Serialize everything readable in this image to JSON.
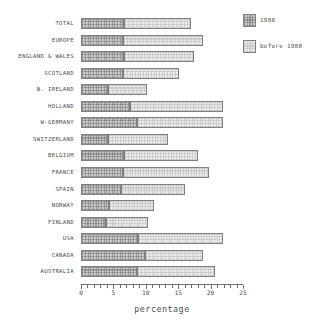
{
  "chart_data": {
    "type": "bar",
    "orientation": "horizontal",
    "stacked": true,
    "title": "",
    "xlabel": "percentage",
    "ylabel": "",
    "xlim": [
      0,
      25
    ],
    "xticks": [
      0,
      5,
      10,
      15,
      20,
      25
    ],
    "xtick_labels": [
      "0",
      "5",
      "10",
      "15",
      "20",
      "25"
    ],
    "minor_tick_step": 1,
    "grid": false,
    "legend_position": "top-right",
    "categories": [
      "TOTAL",
      "EUROPE",
      "ENGLAND & WALES",
      "SCOTLAND",
      "N. IRELAND",
      "HOLLAND",
      "W-GERMANY",
      "SWITZERLAND",
      "BELGIUM",
      "FRANCE",
      "SPAIN",
      "NORWAY",
      "FINLAND",
      "USA",
      "CANADA",
      "AUSTRALIA"
    ],
    "series": [
      {
        "name": "1988",
        "color": "#c9c9c9",
        "values": [
          6.6,
          6.5,
          6.6,
          6.5,
          4.2,
          7.5,
          8.6,
          4.1,
          6.6,
          6.5,
          6.2,
          4.3,
          3.9,
          8.8,
          9.8,
          8.6
        ]
      },
      {
        "name": "before 1988",
        "color": "#ececec",
        "values": [
          10.3,
          12.3,
          10.8,
          8.7,
          6.0,
          14.4,
          13.3,
          9.4,
          11.5,
          13.2,
          9.8,
          6.9,
          6.5,
          13.1,
          9.1,
          12.1
        ]
      }
    ],
    "totals": [
      16.9,
      18.8,
      17.4,
      15.2,
      10.2,
      21.9,
      21.9,
      13.5,
      18.1,
      19.7,
      16.0,
      11.2,
      10.4,
      21.9,
      18.9,
      20.7
    ]
  },
  "legend": {
    "items": [
      {
        "label": "1988",
        "swatch": "hatched-dark"
      },
      {
        "label": "before 1988",
        "swatch": "plain-light"
      }
    ]
  },
  "axis": {
    "x_title": "percentage"
  }
}
